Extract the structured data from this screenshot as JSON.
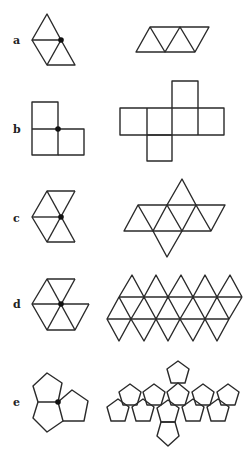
{
  "figure": {
    "rows": [
      {
        "label": "a",
        "solid": "tetrahedron",
        "vertex_figure": "3 triangles around a vertex",
        "net": "4 triangles in a strip"
      },
      {
        "label": "b",
        "solid": "cube",
        "vertex_figure": "3 squares around a vertex",
        "net": "6 squares (cross)"
      },
      {
        "label": "c",
        "solid": "octahedron",
        "vertex_figure": "4 triangles around a vertex",
        "net": "8 triangles"
      },
      {
        "label": "d",
        "solid": "icosahedron",
        "vertex_figure": "5 triangles around a vertex",
        "net": "20 triangles"
      },
      {
        "label": "e",
        "solid": "dodecahedron",
        "vertex_figure": "3 pentagons around a vertex",
        "net": "12 pentagons"
      }
    ],
    "colors": {
      "stroke": "#2a2a2a",
      "background": "#ffffff",
      "vertex_dot": "#111111"
    }
  }
}
